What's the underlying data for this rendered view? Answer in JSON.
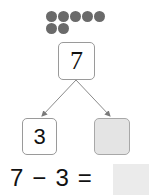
{
  "dots": {
    "count": 7,
    "rows": [
      5,
      2
    ],
    "color": "#6a6a6a"
  },
  "number_bond": {
    "whole": "7",
    "part_known": "3",
    "part_unknown": ""
  },
  "equation": {
    "left_operand": "7",
    "operator": "−",
    "right_operand": "3",
    "equals": "=",
    "answer": ""
  },
  "colors": {
    "box_border": "#9a9a9a",
    "unknown_fill": "#e4e4e4",
    "arrow": "#8a8a8a"
  }
}
